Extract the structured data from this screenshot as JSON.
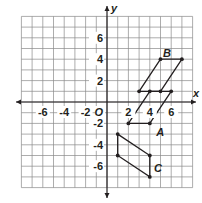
{
  "diagram": {
    "type": "coordinate-plane",
    "axes": {
      "x_label": "x",
      "y_label": "y",
      "origin_label": "O",
      "range": [
        -8,
        8
      ],
      "x_ticks": [
        "-6",
        "-4",
        "-2",
        "2",
        "4",
        "6"
      ],
      "y_ticks": [
        "6",
        "4",
        "2",
        "-2",
        "-4",
        "-6"
      ]
    },
    "figures": [
      {
        "label": "A",
        "vertices": [
          [
            2,
            -2
          ],
          [
            4,
            -2
          ],
          [
            6,
            1
          ],
          [
            4,
            1
          ]
        ]
      },
      {
        "label": "B",
        "vertices": [
          [
            3,
            1
          ],
          [
            5,
            1
          ],
          [
            7,
            4
          ],
          [
            5,
            4
          ]
        ]
      },
      {
        "label": "C",
        "vertices": [
          [
            1,
            -3
          ],
          [
            4,
            -5
          ],
          [
            4,
            -7
          ],
          [
            1,
            -5
          ]
        ]
      }
    ],
    "colors": {
      "grid": "#8a8a8a",
      "ink": "#231f20",
      "background": "#ffffff"
    }
  }
}
